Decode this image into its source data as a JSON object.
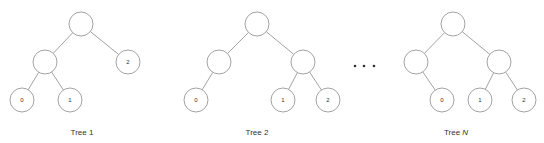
{
  "header_cut_text": "",
  "ellipsis_dots": [
    {
      "x": 355,
      "y": 66
    },
    {
      "x": 364,
      "y": 66
    },
    {
      "x": 374,
      "y": 66
    }
  ],
  "trees": [
    {
      "label": "Tree 1",
      "label_base": "Tree",
      "label_suffix": "1",
      "label_suffix_italic": false,
      "label_x": 82,
      "nodes": [
        {
          "id": "r",
          "x": 81,
          "y": 24,
          "label": ""
        },
        {
          "id": "a",
          "x": 45,
          "y": 62,
          "label": ""
        },
        {
          "id": "b",
          "x": 128,
          "y": 62,
          "label": "2"
        },
        {
          "id": "c",
          "x": 22,
          "y": 100,
          "label": "0"
        },
        {
          "id": "d",
          "x": 70,
          "y": 100,
          "label": "1"
        }
      ],
      "edges": [
        [
          "r",
          "a"
        ],
        [
          "r",
          "b"
        ],
        [
          "a",
          "c"
        ],
        [
          "a",
          "d"
        ]
      ]
    },
    {
      "label": "Tree 2",
      "label_base": "Tree",
      "label_suffix": "2",
      "label_suffix_italic": false,
      "label_x": 257,
      "nodes": [
        {
          "id": "r",
          "x": 257,
          "y": 24,
          "label": ""
        },
        {
          "id": "a",
          "x": 219,
          "y": 62,
          "label": ""
        },
        {
          "id": "b",
          "x": 303,
          "y": 62,
          "label": ""
        },
        {
          "id": "c",
          "x": 196,
          "y": 100,
          "label": "0"
        },
        {
          "id": "d",
          "x": 283,
          "y": 100,
          "label": "1"
        },
        {
          "id": "e",
          "x": 328,
          "y": 100,
          "label": "2"
        }
      ],
      "edges": [
        [
          "r",
          "a"
        ],
        [
          "r",
          "b"
        ],
        [
          "a",
          "c"
        ],
        [
          "b",
          "d"
        ],
        [
          "b",
          "e"
        ]
      ]
    },
    {
      "label": "Tree N",
      "label_base": "Tree",
      "label_suffix": "N",
      "label_suffix_italic": true,
      "label_x": 456,
      "nodes": [
        {
          "id": "r",
          "x": 453,
          "y": 24,
          "label": ""
        },
        {
          "id": "a",
          "x": 416,
          "y": 62,
          "label": ""
        },
        {
          "id": "b",
          "x": 499,
          "y": 62,
          "label": ""
        },
        {
          "id": "c",
          "x": 442,
          "y": 100,
          "label": "0"
        },
        {
          "id": "d",
          "x": 480,
          "y": 100,
          "label": "1"
        },
        {
          "id": "e",
          "x": 524,
          "y": 100,
          "label": "2"
        }
      ],
      "edges": [
        [
          "r",
          "a"
        ],
        [
          "r",
          "b"
        ],
        [
          "a",
          "c"
        ],
        [
          "b",
          "d"
        ],
        [
          "b",
          "e"
        ]
      ]
    }
  ],
  "node_radius": 12,
  "colors": {
    "stroke": "#8a8a8a",
    "text": "#333333",
    "background": "#ffffff"
  }
}
